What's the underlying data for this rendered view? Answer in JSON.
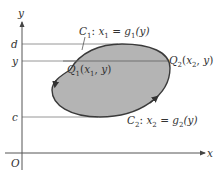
{
  "diagram": {
    "type": "region-between-curves",
    "axes": {
      "x_label": "x",
      "y_label": "y",
      "origin_label": "O"
    },
    "levels": {
      "d_label": "d",
      "y_label": "y",
      "c_label": "c"
    },
    "curves": {
      "c1": {
        "name": "C",
        "sub": "1",
        "eq_lhs": "x",
        "eq_lhs_sub": "1",
        "eq_rhs": "g",
        "eq_rhs_sub": "1",
        "arg": "(y)"
      },
      "c2": {
        "name": "C",
        "sub": "2",
        "eq_lhs": "x",
        "eq_lhs_sub": "2",
        "eq_rhs": "g",
        "eq_rhs_sub": "2",
        "arg": "(y)"
      }
    },
    "points": {
      "q1": {
        "name": "Q",
        "sub": "1",
        "coord_x": "x",
        "coord_x_sub": "1",
        "coord_y": "y"
      },
      "q2": {
        "name": "Q",
        "sub": "2",
        "coord_x": "x",
        "coord_x_sub": "2",
        "coord_y": "y"
      }
    },
    "colors": {
      "region_fill": "#b4b4b4",
      "boundary": "#3a3a3a",
      "axis": "#555555",
      "guide_line": "#8a8a8a",
      "text": "#333333"
    }
  }
}
